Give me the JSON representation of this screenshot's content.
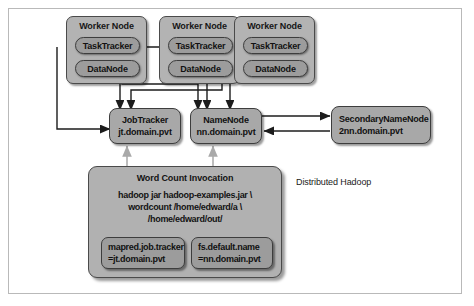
{
  "diagram": {
    "caption": "Distributed Hadoop",
    "worker_nodes": [
      {
        "title": "Worker Node",
        "tasktracker": "TaskTracker",
        "datanode": "DataNode"
      },
      {
        "title": "Worker Node",
        "tasktracker": "TaskTracker",
        "datanode": "DataNode"
      },
      {
        "title": "Worker Node",
        "tasktracker": "TaskTracker",
        "datanode": "DataNode"
      }
    ],
    "services": {
      "jobtracker": {
        "name": "JobTracker",
        "host": "jt.domain.pvt"
      },
      "namenode": {
        "name": "NameNode",
        "host": "nn.domain.pvt"
      },
      "secondarynamenode": {
        "name": "SecondaryNameNode",
        "host": "2nn.domain.pvt"
      }
    },
    "invocation": {
      "title": "Word Count Invocation",
      "command_line_1": "hadoop jar hadoop-examples.jar \\",
      "command_line_2": "wordcount /home/edward/a \\",
      "command_line_3": "/home/edward/out/",
      "configs": [
        {
          "key": "mapred.job.tracker",
          "value": "=jt.domain.pvt"
        },
        {
          "key": "fs.default.name",
          "value": "=nn.domain.pvt"
        }
      ]
    },
    "colors": {
      "node_fill": "#b3b3b3",
      "pill_fill": "#9c9c9c",
      "service_fill": "#a8a8a8",
      "wire_dark": "#1c1c1c",
      "wire_light": "#a9a9a9",
      "frame_border": "#b9b9b9"
    }
  }
}
